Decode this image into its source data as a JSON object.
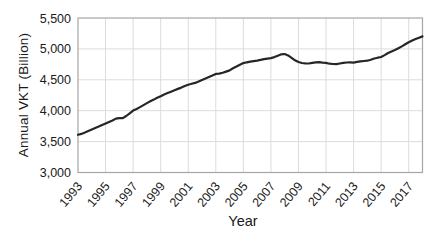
{
  "chart_data": {
    "type": "line",
    "title": "",
    "xlabel": "Year",
    "ylabel": "Annual VKT (Billion)",
    "xlim": [
      1993,
      2018
    ],
    "ylim": [
      3000,
      5500
    ],
    "xticks": [
      1993,
      1995,
      1997,
      1999,
      2001,
      2003,
      2005,
      2007,
      2009,
      2011,
      2013,
      2015,
      2017
    ],
    "xtick_labels": [
      "1993",
      "1995",
      "1997",
      "1999",
      "2001",
      "2003",
      "2005",
      "2007",
      "2009",
      "2011",
      "2013",
      "2015",
      "2017"
    ],
    "yticks": [
      3000,
      3500,
      4000,
      4500,
      5000,
      5500
    ],
    "ytick_labels": [
      "3,000",
      "3,500",
      "4,000",
      "4,500",
      "5,000",
      "5,500"
    ],
    "grid": true,
    "legend_position": "none",
    "colors": {
      "line": "#262626",
      "grid": "#dcdcdc",
      "border": "#a6a6a6",
      "text": "#1a1a1a",
      "background": "#ffffff"
    },
    "series": [
      {
        "name": "Annual VKT (Billion)",
        "x": [
          1993,
          1993.25,
          1993.5,
          1993.75,
          1994,
          1994.25,
          1994.5,
          1994.75,
          1995,
          1995.25,
          1995.5,
          1995.75,
          1996,
          1996.25,
          1996.5,
          1996.75,
          1997,
          1997.25,
          1997.5,
          1997.75,
          1998,
          1998.25,
          1998.5,
          1998.75,
          1999,
          1999.25,
          1999.5,
          1999.75,
          2000,
          2000.25,
          2000.5,
          2000.75,
          2001,
          2001.25,
          2001.5,
          2001.75,
          2002,
          2002.25,
          2002.5,
          2002.75,
          2003,
          2003.25,
          2003.5,
          2003.75,
          2004,
          2004.25,
          2004.5,
          2004.75,
          2005,
          2005.25,
          2005.5,
          2005.75,
          2006,
          2006.25,
          2006.5,
          2006.75,
          2007,
          2007.25,
          2007.5,
          2007.75,
          2008,
          2008.25,
          2008.5,
          2008.75,
          2009,
          2009.25,
          2009.5,
          2009.75,
          2010,
          2010.25,
          2010.5,
          2010.75,
          2011,
          2011.25,
          2011.5,
          2011.75,
          2012,
          2012.25,
          2012.5,
          2012.75,
          2013,
          2013.25,
          2013.5,
          2013.75,
          2014,
          2014.25,
          2014.5,
          2014.75,
          2015,
          2015.25,
          2015.5,
          2015.75,
          2016,
          2016.25,
          2016.5,
          2016.75,
          2017,
          2017.25,
          2017.5,
          2017.75,
          2018
        ],
        "values": [
          3610,
          3625,
          3648,
          3672,
          3695,
          3718,
          3742,
          3768,
          3794,
          3818,
          3842,
          3872,
          3880,
          3878,
          3915,
          3958,
          4001,
          4028,
          4058,
          4090,
          4123,
          4152,
          4180,
          4208,
          4235,
          4260,
          4284,
          4308,
          4331,
          4352,
          4374,
          4398,
          4420,
          4436,
          4450,
          4472,
          4499,
          4522,
          4546,
          4570,
          4595,
          4601,
          4614,
          4632,
          4652,
          4686,
          4716,
          4745,
          4771,
          4783,
          4794,
          4803,
          4811,
          4822,
          4833,
          4843,
          4851,
          4868,
          4890,
          4912,
          4918,
          4895,
          4855,
          4815,
          4788,
          4772,
          4766,
          4764,
          4774,
          4781,
          4784,
          4779,
          4774,
          4761,
          4755,
          4752,
          4764,
          4774,
          4780,
          4781,
          4778,
          4789,
          4799,
          4804,
          4809,
          4824,
          4844,
          4857,
          4869,
          4899,
          4933,
          4958,
          4981,
          5010,
          5041,
          5074,
          5108,
          5134,
          5159,
          5181,
          5203
        ]
      }
    ],
    "layout": {
      "plot_left": 78,
      "plot_top": 18,
      "plot_right": 422.5,
      "plot_bottom": 172.5,
      "line_width": 2.2
    }
  }
}
